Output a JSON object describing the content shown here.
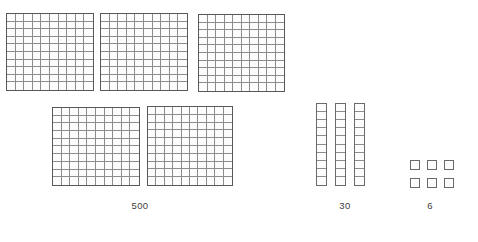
{
  "worksheet": {
    "instruction": "Draw quick pictures to represent 536.",
    "represented_number": "536"
  },
  "groups": [
    {
      "id": "hundreds",
      "label": "500",
      "label_x": 140,
      "label_y": 200,
      "piece_type": "hundred-flat",
      "piece_count": 5,
      "cells_per_piece": 100,
      "value_per_piece": 100,
      "total_value": 500,
      "pieces": [
        {
          "x": 6,
          "y": 13,
          "w": 88,
          "h": 78
        },
        {
          "x": 100,
          "y": 13,
          "w": 88,
          "h": 78
        },
        {
          "x": 198,
          "y": 14,
          "w": 87,
          "h": 78
        },
        {
          "x": 52,
          "y": 107,
          "w": 88,
          "h": 79
        },
        {
          "x": 147,
          "y": 106,
          "w": 86,
          "h": 80
        }
      ]
    },
    {
      "id": "tens",
      "label": "30",
      "label_x": 345,
      "label_y": 200,
      "piece_type": "ten-rod",
      "piece_count": 3,
      "cells_per_piece": 10,
      "value_per_piece": 10,
      "total_value": 30,
      "pieces": [
        {
          "x": 316,
          "y": 103,
          "w": 11,
          "h": 83
        },
        {
          "x": 335,
          "y": 103,
          "w": 11,
          "h": 83
        },
        {
          "x": 354,
          "y": 103,
          "w": 11,
          "h": 83
        }
      ]
    },
    {
      "id": "ones",
      "label": "6",
      "label_x": 430,
      "label_y": 200,
      "piece_type": "one-unit",
      "piece_count": 6,
      "cells_per_piece": 1,
      "value_per_piece": 1,
      "total_value": 6,
      "pieces": [
        {
          "x": 410,
          "y": 160,
          "w": 10,
          "h": 10
        },
        {
          "x": 427,
          "y": 160,
          "w": 10,
          "h": 10
        },
        {
          "x": 444,
          "y": 160,
          "w": 10,
          "h": 10
        },
        {
          "x": 410,
          "y": 178,
          "w": 10,
          "h": 10
        },
        {
          "x": 427,
          "y": 178,
          "w": 10,
          "h": 10
        },
        {
          "x": 444,
          "y": 178,
          "w": 10,
          "h": 10
        }
      ]
    }
  ],
  "colors": {
    "page_background": "#ffffff",
    "piece_outline": "#585858",
    "grid_line": "#8c8c8c",
    "piece_fill": "#fcfcfc",
    "label_text": "#404040"
  }
}
